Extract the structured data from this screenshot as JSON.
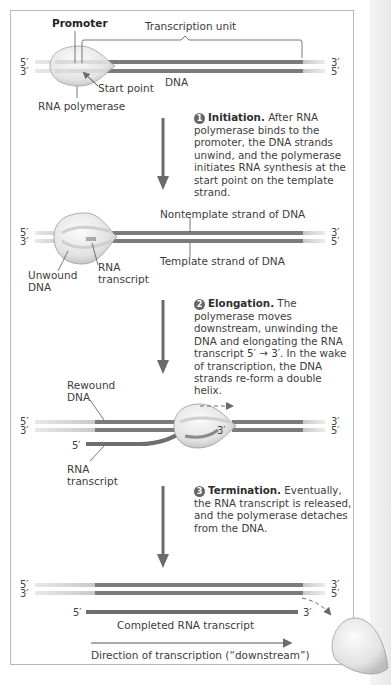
{
  "figure": {
    "colors": {
      "dna_strand": "#7a7a7a",
      "promoter_region": "#d4d4d4",
      "polymerase_fill": "#e6e6e6",
      "rna": "#6e6e6e",
      "arrow": "#6a6a6a",
      "frame": "#b8b8b8"
    }
  },
  "panel1": {
    "promoter": "Promoter",
    "transcription_unit": "Transcription unit",
    "dna": "DNA",
    "start_point": "Start point",
    "rna_polymerase": "RNA polymerase",
    "left_top": "5′",
    "left_bottom": "3′",
    "right_top": "3′",
    "right_bottom": "5′"
  },
  "step1": {
    "number": "1",
    "heading": "Initiation.",
    "text": " After RNA polymerase binds to the promoter, the DNA strands unwind, and the polymerase initiates RNA synthesis at the start point on the template strand."
  },
  "panel2": {
    "nontemplate": "Nontemplate strand of DNA",
    "template": "Template strand of DNA",
    "unwound_dna_1": "Unwound",
    "unwound_dna_2": "DNA",
    "rna_transcript_1": "RNA",
    "rna_transcript_2": "transcript",
    "left_top": "5′",
    "left_bottom": "3′",
    "right_top": "3′",
    "right_bottom": "5′"
  },
  "step2": {
    "number": "2",
    "heading": "Elongation.",
    "text": " The polymerase moves downstream, unwinding the DNA and elongating the RNA transcript 5′ → 3′. In the wake of transcription, the DNA strands re-form a double helix."
  },
  "panel3": {
    "rewound_1": "Rewound",
    "rewound_2": "DNA",
    "rna_5prime": "5′",
    "rna_3prime": "3′",
    "rna_transcript_1": "RNA",
    "rna_transcript_2": "transcript",
    "left_top": "5′",
    "left_bottom": "3′",
    "right_top": "3′",
    "right_bottom": "5′"
  },
  "step3": {
    "number": "3",
    "heading": "Termination.",
    "text": " Eventually, the RNA transcript is released, and the polymerase detaches from the DNA."
  },
  "panel4": {
    "left_top": "5′",
    "left_bottom": "3′",
    "right_top": "3′",
    "right_bottom": "5′",
    "rna_5prime": "5′",
    "rna_3prime": "3′",
    "completed": "Completed RNA transcript",
    "direction": "Direction of transcription (“downstream”)"
  }
}
